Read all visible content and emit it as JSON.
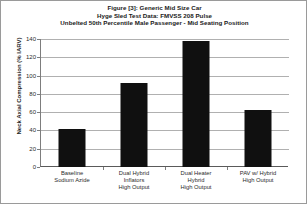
{
  "chart_data": {
    "type": "bar",
    "title": "Figure [3]: Generic Mid Size Car",
    "subtitle": "Hyge Sled Test Data: FMVSS 208 Pulse",
    "subtitle2": "Unbelted 50th Percentile Male Passenger - Mid Seating Position",
    "title_lines": [
      "Figure [3]: Generic Mid Size Car",
      "Hyge Sled Test Data: FMVSS 208 Pulse",
      "Unbelted 50th Percentile Male Passenger - Mid Seating Position"
    ],
    "xlabel": "",
    "ylabel": "Neck Axial Compression (% IARV)",
    "ylim": [
      0,
      140
    ],
    "ytick_step": 20,
    "yticks": [
      0,
      20,
      40,
      60,
      80,
      100,
      120,
      140
    ],
    "ytick_labels": [
      "0",
      "20",
      "40",
      "60",
      "80",
      "100",
      "120",
      "140"
    ],
    "grid": true,
    "grid_axis": "y",
    "legend": false,
    "legend_position": "none",
    "bar_color": "#101010",
    "categories": [
      "Baseline Sodium Azide",
      "Dual Hybrid Inflators High Output",
      "Dual Heater Hybrid High Output",
      "PAV w/ Hybrid High Output"
    ],
    "category_lines": [
      [
        "Baseline",
        "Sodium Azide"
      ],
      [
        "Dual Hybrid",
        "Inflators",
        "High Output"
      ],
      [
        "Dual Heater",
        "Hybrid",
        "High Output"
      ],
      [
        "PAV w/ Hybrid",
        "High Output"
      ]
    ],
    "values": [
      42,
      92,
      138,
      62
    ],
    "series": [
      {
        "name": "Neck Axial Compression (% IARV)",
        "values": [
          42,
          92,
          138,
          62
        ]
      }
    ]
  }
}
